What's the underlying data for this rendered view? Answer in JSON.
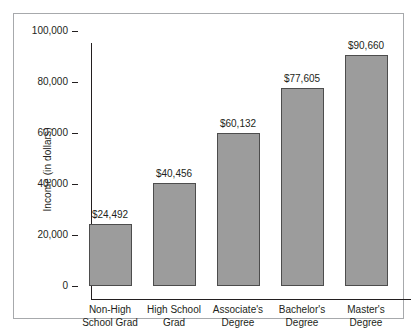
{
  "chart_data": {
    "type": "bar",
    "title": "",
    "xlabel": "",
    "ylabel": "Income (in dollars)",
    "ylim": [
      0,
      100000
    ],
    "grid": false,
    "legend": null,
    "categories": [
      "Non-High School Grad",
      "High School Grad",
      "Associate's Degree",
      "Bachelor's Degree",
      "Master's Degree"
    ],
    "category_lines": [
      [
        "Non-High",
        "School Grad"
      ],
      [
        "High School",
        "Grad"
      ],
      [
        "Associate's",
        "Degree"
      ],
      [
        "Bachelor's",
        "Degree"
      ],
      [
        "Master's",
        "Degree"
      ]
    ],
    "values": [
      24492,
      40456,
      60132,
      77605,
      90660
    ],
    "value_labels": [
      "$24,492",
      "$40,456",
      "$60,132",
      "$77,605",
      "$90,660"
    ],
    "ytick_values": [
      0,
      20000,
      40000,
      60000,
      80000,
      100000
    ],
    "ytick_labels": [
      "0",
      "20,000",
      "40,000",
      "60,000",
      "80,000",
      "100,000"
    ],
    "colors": {
      "bar_fill": "#9c9c9c",
      "bar_border": "#4d4d4d",
      "axis": "#231f20",
      "frame": "#a7a9ac",
      "background": "#ffffff",
      "text": "#231f20"
    }
  }
}
